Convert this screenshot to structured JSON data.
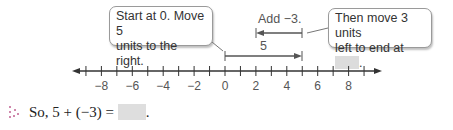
{
  "callouts": {
    "left": {
      "line1": "Start at 0. Move 5",
      "line2": "units to the right."
    },
    "right": {
      "line1": "Then move 3 units",
      "line2": "left to end at",
      "suffix": "."
    }
  },
  "arrows": {
    "add_label": "Add −3.",
    "five_label": "5"
  },
  "number_line": {
    "min": -9,
    "max": 9,
    "labels": [
      "−8",
      "−6",
      "−4",
      "−2",
      "0",
      "2",
      "4",
      "6",
      "8"
    ]
  },
  "equation": {
    "text": "So, 5 + (−3) =",
    "suffix": "."
  }
}
